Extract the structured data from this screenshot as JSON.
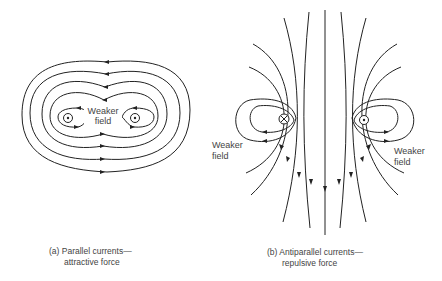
{
  "diagram": {
    "panel_a": {
      "wires": [
        {
          "symbol": "dot",
          "meaning": "current out of page"
        },
        {
          "symbol": "dot",
          "meaning": "current out of page"
        }
      ],
      "center_label_line1": "Weaker",
      "center_label_line2": "field",
      "caption_line1": "(a) Parallel currents—",
      "caption_line2": "attractive force"
    },
    "panel_b": {
      "wires": [
        {
          "symbol": "cross",
          "meaning": "current into page"
        },
        {
          "symbol": "dot",
          "meaning": "current out of page"
        }
      ],
      "left_label_line1": "Weaker",
      "left_label_line2": "field",
      "right_label_line1": "Weaker",
      "right_label_line2": "field",
      "caption_line1": "(b) Antiparallel currents—",
      "caption_line2": "repulsive force"
    },
    "colors": {
      "line": "#222222",
      "text": "#444444",
      "background": "#ffffff"
    }
  }
}
